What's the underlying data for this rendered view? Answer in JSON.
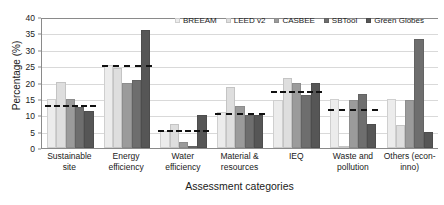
{
  "chart_data": {
    "type": "bar",
    "title": "",
    "xlabel": "Assessment categories",
    "ylabel": "Percentage (%)",
    "ylim": [
      0,
      40
    ],
    "ytick_step": 5,
    "yticks": [
      0,
      5,
      10,
      15,
      20,
      25,
      30,
      35,
      40
    ],
    "grid": true,
    "legend_position": "top-right",
    "categories": [
      "Sustainable site",
      "Energy efficiency",
      "Water efficiency",
      "Material & resources",
      "IEQ",
      "Waste and pollution",
      "Others (econ-inno)"
    ],
    "category_lines": [
      [
        "Sustainable site"
      ],
      [
        "Energy",
        "efficiency"
      ],
      [
        "Water",
        "efficiency"
      ],
      [
        "Material &",
        "resources"
      ],
      [
        "IEQ"
      ],
      [
        "Waste and",
        "pollution"
      ],
      [
        "Others (econ-",
        "inno)"
      ]
    ],
    "series": [
      {
        "name": "BREEAM",
        "color": "#ececec",
        "values": [
          15.0,
          25.2,
          5.3,
          11.0,
          14.8,
          15.0,
          15.0
        ]
      },
      {
        "name": "LEED v2",
        "color": "#dedede",
        "values": [
          20.1,
          24.4,
          7.2,
          18.6,
          21.4,
          0.0,
          7.0
        ]
      },
      {
        "name": "CASBEE",
        "color": "#9b9b9b",
        "values": [
          15.0,
          20.0,
          1.8,
          12.9,
          19.7,
          14.8,
          14.7
        ]
      },
      {
        "name": "SBTool",
        "color": "#6e6e6e",
        "values": [
          12.4,
          20.9,
          0.0,
          10.0,
          16.3,
          16.4,
          33.2
        ]
      },
      {
        "name": "Green Globes",
        "color": "#565656",
        "values": [
          11.3,
          35.9,
          10.0,
          10.0,
          19.8,
          7.4,
          4.9
        ]
      }
    ],
    "average_lines": {
      "name": "Average",
      "style": "dashed",
      "color": "#111111",
      "values": [
        13.0,
        25.3,
        5.4,
        10.8,
        17.5,
        11.9,
        null
      ]
    }
  }
}
